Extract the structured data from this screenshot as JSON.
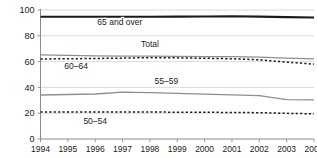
{
  "chart_data": {
    "type": "line",
    "title": "",
    "xlabel": "",
    "ylabel": "",
    "x": [
      1994,
      1995,
      1996,
      1997,
      1998,
      1999,
      2000,
      2001,
      2002,
      2003,
      2004
    ],
    "xtick_labels": [
      "1994",
      "1995",
      "1996",
      "1997",
      "1998",
      "1999",
      "2000",
      "2001",
      "2002",
      "2003",
      "2004"
    ],
    "ytick_labels": [
      "0",
      "20",
      "40",
      "60",
      "80",
      "100"
    ],
    "yticks": [
      0,
      20,
      40,
      60,
      80,
      100
    ],
    "ylim": [
      0,
      100
    ],
    "xlim": [
      1994,
      2004
    ],
    "grid": "horizontal",
    "legend_position": "inline-labels",
    "series": [
      {
        "name": "65 and over",
        "label": "65 and over",
        "style": "solid",
        "color": "#1a1a1a",
        "width": 2.1,
        "values": [
          94.8,
          94.8,
          94.8,
          94.8,
          94.8,
          94.9,
          95.0,
          95.2,
          94.9,
          94.5,
          94.2
        ],
        "label_x": 1996.9,
        "label_y": 88.5
      },
      {
        "name": "Total",
        "label": "Total",
        "style": "solid",
        "color": "#8f8f8f",
        "width": 1.2,
        "values": [
          65.2,
          64.9,
          64.5,
          64.3,
          64.2,
          64.1,
          63.9,
          63.8,
          63.4,
          62.7,
          62.1
        ],
        "label_x": 1998.0,
        "label_y": 71.0
      },
      {
        "name": "60-64",
        "label": "60–64",
        "style": "dashed",
        "color": "#1a1a1a",
        "width": 1.5,
        "values": [
          62.0,
          62.2,
          62.4,
          62.7,
          63.1,
          62.9,
          62.6,
          62.2,
          61.4,
          59.6,
          58.0
        ],
        "label_x": 1995.3,
        "label_y": 54.0
      },
      {
        "name": "55-59",
        "label": "55–59",
        "style": "solid",
        "color": "#8f8f8f",
        "width": 1.3,
        "values": [
          34.1,
          34.5,
          34.9,
          36.4,
          36.0,
          35.3,
          34.8,
          34.2,
          33.7,
          30.6,
          30.3
        ],
        "label_x": 1998.6,
        "label_y": 43.0
      },
      {
        "name": "50-54",
        "label": "50–54",
        "style": "dashed",
        "color": "#1a1a1a",
        "width": 1.5,
        "values": [
          21.0,
          21.0,
          21.0,
          20.9,
          20.9,
          20.8,
          20.7,
          20.6,
          20.4,
          19.9,
          19.5
        ],
        "label_x": 1996.0,
        "label_y": 11.5
      }
    ]
  }
}
